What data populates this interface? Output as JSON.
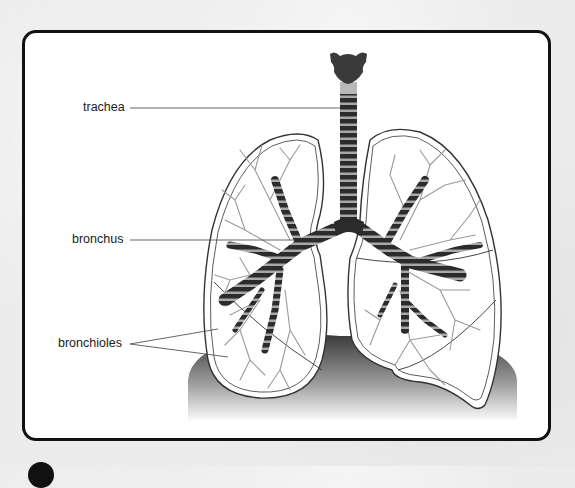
{
  "figure": {
    "labels": [
      {
        "id": "trachea",
        "text": "trachea"
      },
      {
        "id": "bronchus",
        "text": "bronchus"
      },
      {
        "id": "bronchioles",
        "text": "bronchioles"
      }
    ]
  },
  "colors": {
    "frame_border": "#111111",
    "card_bg": "#ffffff",
    "airway_dark": "#2b2b2b",
    "airway_light": "#9a9a9a",
    "bronchiole_gray": "#8c8c8c",
    "diaphragm_top": "#3a3a3a",
    "diaphragm_bottom": "#ffffff",
    "leader_line": "#555555"
  }
}
